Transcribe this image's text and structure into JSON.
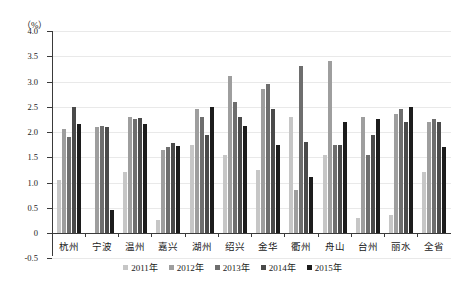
{
  "chart_data": {
    "type": "bar",
    "title": "",
    "xlabel": "",
    "ylabel": "（%）",
    "unit_label": "（%）",
    "ylim": [
      -0.5,
      4.0
    ],
    "ytick_step": 0.5,
    "yticks": [
      "4.0",
      "3.5",
      "3.0",
      "2.5",
      "2.0",
      "1.5",
      "1.0",
      "0.5",
      "0",
      "-0.5"
    ],
    "ytick_values": [
      4.0,
      3.5,
      3.0,
      2.5,
      2.0,
      1.5,
      1.0,
      0.5,
      0.0,
      -0.5
    ],
    "grid": true,
    "legend_position": "bottom",
    "categories": [
      "杭州",
      "宁波",
      "温州",
      "嘉兴",
      "湖州",
      "绍兴",
      "金华",
      "衢州",
      "舟山",
      "台州",
      "丽水",
      "全省"
    ],
    "series": [
      {
        "name": "2011年",
        "color": "#c6c6c6",
        "values": [
          1.05,
          0.0,
          1.2,
          0.25,
          1.75,
          1.55,
          1.25,
          2.3,
          1.55,
          0.3,
          0.35,
          1.2
        ]
      },
      {
        "name": "2012年",
        "color": "#9e9e9e",
        "values": [
          2.05,
          2.1,
          2.3,
          1.65,
          2.45,
          3.1,
          2.85,
          0.85,
          3.4,
          2.3,
          2.35,
          2.2
        ]
      },
      {
        "name": "2013年",
        "color": "#6e6e6e",
        "values": [
          1.9,
          2.12,
          2.25,
          1.7,
          2.3,
          2.6,
          2.95,
          3.3,
          1.75,
          1.55,
          2.45,
          2.25
        ]
      },
      {
        "name": "2014年",
        "color": "#4a4a4a",
        "values": [
          2.5,
          2.1,
          2.28,
          1.78,
          1.95,
          2.3,
          2.45,
          1.8,
          1.75,
          1.95,
          2.2,
          2.2
        ]
      },
      {
        "name": "2015年",
        "color": "#1c1c1c",
        "values": [
          2.15,
          0.45,
          2.15,
          1.72,
          2.5,
          2.12,
          1.75,
          1.1,
          2.2,
          2.25,
          2.5,
          1.7
        ]
      }
    ]
  }
}
